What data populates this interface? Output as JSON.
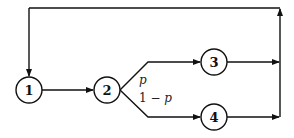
{
  "diagram": {
    "type": "queueing-network",
    "nodes": [
      {
        "id": "1",
        "label": "1",
        "cx": 29,
        "cy": 90
      },
      {
        "id": "2",
        "label": "2",
        "cx": 107,
        "cy": 90
      },
      {
        "id": "3",
        "label": "3",
        "cx": 214,
        "cy": 62
      },
      {
        "id": "4",
        "label": "4",
        "cx": 214,
        "cy": 117
      }
    ],
    "edges": [
      {
        "from": "1",
        "to": "2"
      },
      {
        "from": "2",
        "to": "3",
        "label": "p"
      },
      {
        "from": "2",
        "to": "4",
        "label": "1 − p"
      },
      {
        "from": "3",
        "to": "merge"
      },
      {
        "from": "4",
        "to": "merge"
      },
      {
        "from": "merge",
        "to": "1",
        "note": "feedback loop"
      }
    ],
    "labels": {
      "node1": "1",
      "node2": "2",
      "node3": "3",
      "node4": "4",
      "branch_upper": "p",
      "branch_lower_prefix": "1 − ",
      "branch_lower_var": "p"
    },
    "colors": {
      "stroke": "#111111",
      "background": "#ffffff"
    }
  }
}
